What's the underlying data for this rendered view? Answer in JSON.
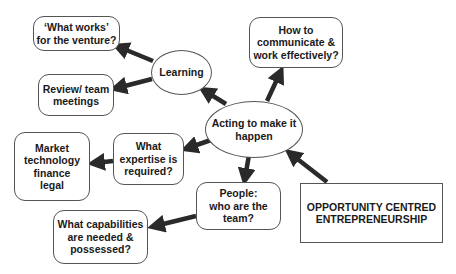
{
  "diagram": {
    "nodes": {
      "what_works": {
        "lines": [
          "‘What works’",
          "for the venture?"
        ]
      },
      "review": {
        "lines": [
          "Review/ team",
          "meetings"
        ]
      },
      "learning": {
        "lines": [
          "Learning"
        ]
      },
      "communicate": {
        "lines": [
          "How to",
          "communicate &",
          "work effectively?"
        ]
      },
      "acting": {
        "lines": [
          "Acting to make it",
          "happen"
        ]
      },
      "market": {
        "lines": [
          "Market",
          "technology",
          "finance",
          "legal"
        ]
      },
      "expertise": {
        "lines": [
          "What",
          "expertise is",
          "required?"
        ]
      },
      "people": {
        "lines": [
          "People:",
          "who are the",
          "team?"
        ]
      },
      "capabilities": {
        "lines": [
          "What capabilities",
          "are needed &",
          "possessed?"
        ]
      },
      "oce": {
        "lines": [
          "OPPORTUNITY CENTRED",
          "ENTREPRENEURSHIP"
        ]
      }
    },
    "edges": [
      {
        "from": "learning",
        "to": "what_works"
      },
      {
        "from": "learning",
        "to": "review"
      },
      {
        "from": "acting",
        "to": "learning"
      },
      {
        "from": "acting",
        "to": "communicate"
      },
      {
        "from": "acting",
        "to": "expertise"
      },
      {
        "from": "acting",
        "to": "people"
      },
      {
        "from": "expertise",
        "to": "market"
      },
      {
        "from": "people",
        "to": "capabilities"
      },
      {
        "from": "oce",
        "to": "acting"
      }
    ],
    "colors": {
      "arrow": "#2a2a2a",
      "border": "#555555",
      "text": "#1a1a1a"
    }
  }
}
